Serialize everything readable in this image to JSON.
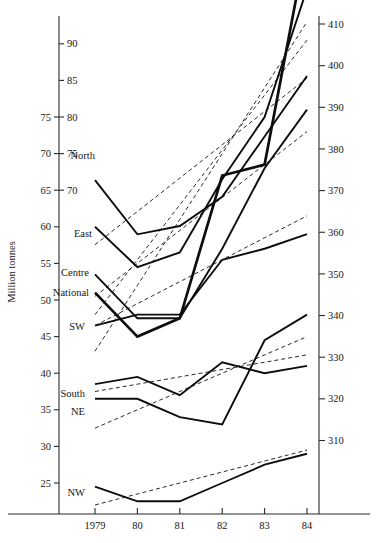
{
  "chart_data": {
    "type": "line",
    "title": "",
    "subtitle": "",
    "xlabel": "",
    "ylabel": "Million tonnes",
    "grid": false,
    "legend_position": "inline-left-labels",
    "x": [
      "1979",
      "80",
      "81",
      "82",
      "83",
      "84"
    ],
    "x_tick_labels": [
      "1979",
      "80",
      "81",
      "82",
      "83",
      "84"
    ],
    "left_axis": {
      "label": "Million tonnes",
      "outer_ticks": [
        25,
        30,
        35,
        40,
        45,
        50,
        55,
        60,
        65,
        70,
        75
      ],
      "inner_ticks": [
        70,
        75,
        80,
        85,
        90
      ],
      "note_outer_range": [
        25,
        75
      ],
      "note_inner_range": [
        70,
        90
      ]
    },
    "right_axis": {
      "ticks": [
        310,
        320,
        330,
        340,
        350,
        360,
        370,
        380,
        390,
        400,
        410
      ],
      "ylim": [
        305,
        412
      ]
    },
    "series": [
      {
        "name": "North",
        "label": "North",
        "style": "solid",
        "axis": "right",
        "values": [
          372.5,
          359.5,
          361.5,
          368.5,
          383.0,
          397.5
        ]
      },
      {
        "name": "East",
        "label": "East",
        "style": "solid",
        "axis": "left",
        "values": [
          60.0,
          54.5,
          56.5,
          66.5,
          75.0,
          92.5
        ]
      },
      {
        "name": "Centre",
        "label": "Centre",
        "style": "solid",
        "axis": "left",
        "values": [
          53.5,
          47.5,
          47.5,
          57.0,
          68.0,
          76.0
        ]
      },
      {
        "name": "National",
        "label": "National",
        "style": "solid-heavy",
        "axis": "left",
        "values": [
          51.0,
          45.0,
          47.5,
          67.0,
          68.5,
          99.0
        ]
      },
      {
        "name": "SW",
        "label": "SW",
        "style": "solid",
        "axis": "left",
        "values": [
          46.5,
          48.0,
          48.0,
          55.5,
          57.0,
          59.0
        ]
      },
      {
        "name": "South",
        "label": "South",
        "style": "solid",
        "axis": "left",
        "values": [
          38.5,
          39.5,
          37.0,
          41.5,
          40.0,
          41.0
        ]
      },
      {
        "name": "NE",
        "label": "NE",
        "style": "solid",
        "axis": "left",
        "values": [
          36.5,
          36.5,
          34.0,
          33.0,
          44.5,
          48.0
        ]
      },
      {
        "name": "NW",
        "label": "NW",
        "style": "solid",
        "axis": "left",
        "values": [
          24.5,
          22.5,
          22.5,
          25.0,
          27.5,
          29.0
        ]
      }
    ],
    "trend_series": [
      {
        "name": "North-trend",
        "style": "dashed",
        "axis": "right",
        "values": [
          357.0,
          365.0,
          373.0,
          381.0,
          389.0,
          397.0
        ]
      },
      {
        "name": "East-trend",
        "style": "dashed",
        "axis": "left",
        "values": [
          48.0,
          55.5,
          63.0,
          70.5,
          78.0,
          85.5
        ]
      },
      {
        "name": "Centre-trend",
        "style": "dashed",
        "axis": "left",
        "values": [
          50.5,
          55.0,
          59.5,
          64.0,
          68.5,
          73.0
        ]
      },
      {
        "name": "National-trend",
        "style": "dashed",
        "axis": "left",
        "values": [
          43.0,
          52.0,
          61.0,
          70.0,
          79.0,
          88.0
        ]
      },
      {
        "name": "SW-trend",
        "style": "dashed",
        "axis": "left",
        "values": [
          46.5,
          49.5,
          52.5,
          55.5,
          58.5,
          61.5
        ]
      },
      {
        "name": "South-trend",
        "style": "dashed",
        "axis": "left",
        "values": [
          37.5,
          38.5,
          39.5,
          40.5,
          41.5,
          42.5
        ]
      },
      {
        "name": "NE-trend",
        "style": "dashed",
        "axis": "left",
        "values": [
          32.5,
          35.0,
          37.5,
          40.0,
          42.5,
          45.0
        ]
      },
      {
        "name": "NW-trend",
        "style": "dashed",
        "axis": "left",
        "values": [
          22.0,
          23.5,
          25.0,
          26.5,
          28.0,
          29.5
        ]
      }
    ]
  }
}
